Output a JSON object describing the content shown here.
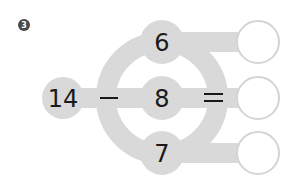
{
  "problem": {
    "number_badge": "3",
    "minuend": "14",
    "operator_minus": "—",
    "operator_equals": "=",
    "subtrahends": [
      "6",
      "8",
      "7"
    ],
    "answers": [
      "",
      "",
      ""
    ]
  },
  "colors": {
    "shape_gray": "#d9d9d9",
    "answer_border": "#d4d4d4",
    "text": "#1a1a1a",
    "badge": "#4a4a4a"
  }
}
